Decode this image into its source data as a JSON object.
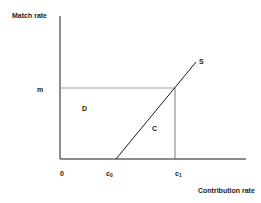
{
  "diagram": {
    "y_axis_label": "Match rate",
    "x_axis_label": "Contribution rate",
    "y_tick_label": "m",
    "x_tick_labels": {
      "origin": "0",
      "c0_base": "c",
      "c0_sub": "0",
      "c1_base": "c",
      "c1_sub": "1"
    },
    "region_labels": {
      "D": "D",
      "C": "C"
    },
    "curve_label": "S",
    "colors": {
      "axis": "#1a1a1a",
      "guide": "#777777",
      "supply": "#1a1a1a",
      "text": "#222222"
    }
  }
}
